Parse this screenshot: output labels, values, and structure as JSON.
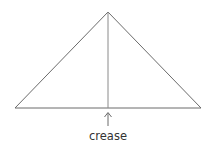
{
  "diagram": {
    "crease_label": "crease",
    "colors": {
      "outline": "#6b6b6b",
      "crease": "#8a8a8a",
      "text": "#333333"
    }
  }
}
